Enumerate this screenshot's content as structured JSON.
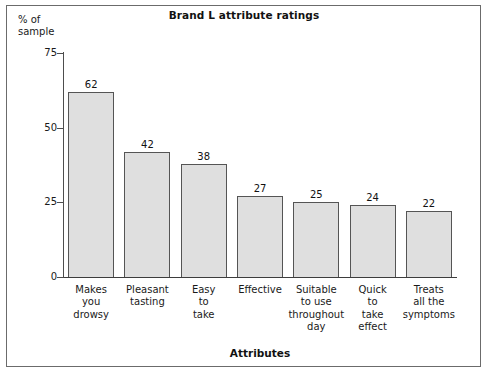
{
  "chart_data": {
    "type": "bar",
    "title": "Brand L attribute ratings",
    "xlabel": "Attributes",
    "ylabel": "% of\nsample",
    "categories": [
      "Makes\nyou\ndrowsy",
      "Pleasant\ntasting",
      "Easy\nto\ntake",
      "Effective",
      "Suitable\nto use\nthroughout\nday",
      "Quick\nto\ntake\neffect",
      "Treats\nall the\nsymptoms"
    ],
    "values": [
      62,
      42,
      38,
      27,
      25,
      24,
      22
    ],
    "value_labels": [
      "62",
      "42",
      "38",
      "27",
      "25",
      "24",
      "22"
    ],
    "yticks": [
      0,
      25,
      50,
      75
    ],
    "ytick_labels": [
      "0",
      "25",
      "50",
      "75"
    ],
    "ylim": [
      0,
      75
    ],
    "grid": false,
    "legend": false,
    "bar_fill": "#dfdfdf",
    "bar_edge": "#555555",
    "axis_color": "#4d4d4d",
    "frame_color": "#6b6b6b",
    "background": "#ffffff"
  }
}
